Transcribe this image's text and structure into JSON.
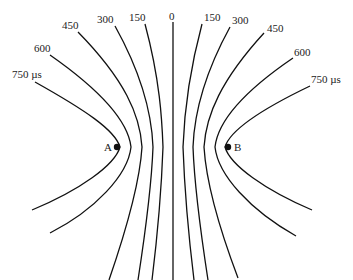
{
  "diagram": {
    "type": "hyperbolic time-difference contours",
    "foci": [
      {
        "label": "A",
        "x": 117,
        "y": 147
      },
      {
        "label": "B",
        "x": 228,
        "y": 147
      }
    ],
    "left_labels": [
      "750 µs",
      "600",
      "450",
      "300",
      "150"
    ],
    "center_label": "0",
    "right_labels": [
      "150",
      "300",
      "450",
      "600",
      "750 µs"
    ],
    "unit": "µs"
  }
}
